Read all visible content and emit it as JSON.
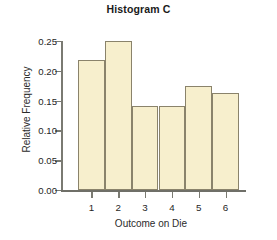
{
  "chart_data": {
    "type": "bar",
    "title": "Histogram C",
    "xlabel": "Outcome on Die",
    "ylabel": "Relative Frequency",
    "categories": [
      "1",
      "2",
      "3",
      "4",
      "5",
      "6"
    ],
    "values": [
      0.218,
      0.25,
      0.141,
      0.141,
      0.174,
      0.163
    ],
    "ylim": [
      0.0,
      0.25
    ],
    "xlim": [
      0.5,
      6.5
    ],
    "ytick_labels": [
      "0.00",
      "0.05",
      "0.10",
      "0.15",
      "0.20",
      "0.25"
    ],
    "ytick_values": [
      0.0,
      0.05,
      0.1,
      0.15,
      0.2,
      0.25
    ],
    "grid": false,
    "legend": null,
    "bar_fill_color": "#f7efcd",
    "bar_edge_color": "#8a836b",
    "axis_color": "#7a7a72",
    "background_color": "#ffffff"
  }
}
